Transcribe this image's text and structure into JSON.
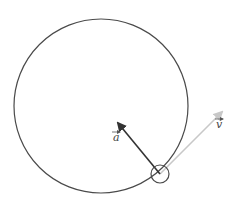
{
  "diagram": {
    "orbit": {
      "cx": 101,
      "cy": 106,
      "r": 87,
      "stroke": "#4a4a4a"
    },
    "body": {
      "cx": 160,
      "cy": 174,
      "r": 9,
      "stroke": "#4a4a4a"
    },
    "vectors": [
      {
        "name": "acceleration",
        "label": "a",
        "from": [
          160,
          174
        ],
        "to": [
          118,
          123
        ],
        "color": "#333333",
        "label_pos": [
          114,
          141
        ],
        "arrow_pos": [
          113,
          132
        ]
      },
      {
        "name": "velocity",
        "label": "v",
        "from": [
          160,
          174
        ],
        "to": [
          222,
          112
        ],
        "color": "#c8c8c8",
        "label_pos": [
          217,
          128
        ],
        "arrow_pos": [
          216,
          119
        ]
      }
    ]
  }
}
